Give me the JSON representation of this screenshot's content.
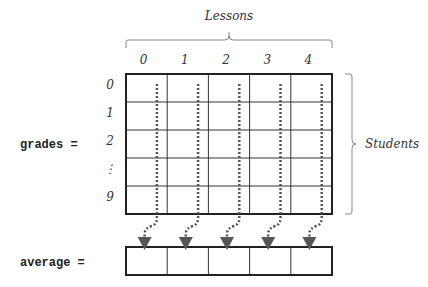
{
  "title": "Lessons",
  "students_label": "Students",
  "grades_label": "grades =",
  "average_label": "average =",
  "column_labels": [
    "0",
    "1",
    "2",
    "3",
    "4"
  ],
  "row_labels": [
    "0",
    "1",
    "2",
    "⋮",
    "9"
  ],
  "colors": {
    "arrow": "#555555",
    "grid": "#222222",
    "bracket": "#888888"
  }
}
